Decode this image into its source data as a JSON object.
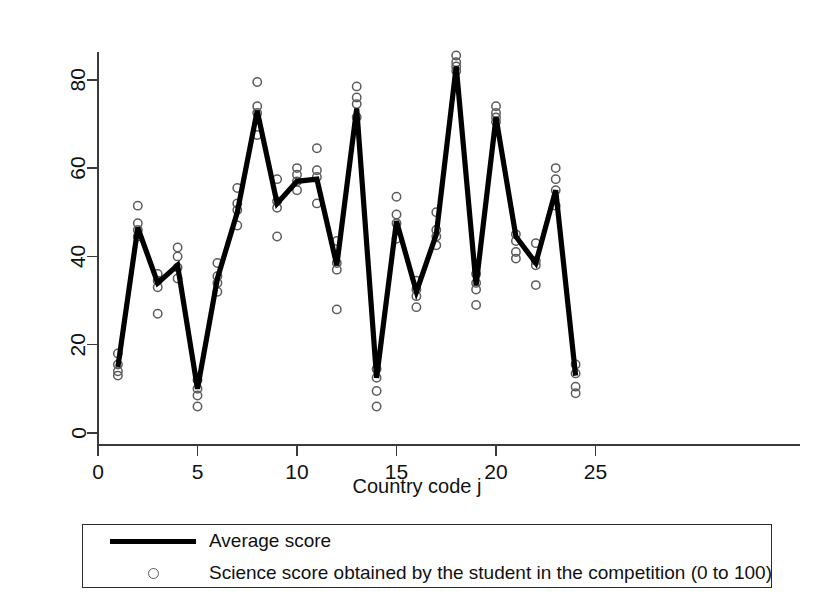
{
  "chart_data": {
    "type": "line",
    "title": "",
    "xlabel": "Country code j",
    "ylabel": "",
    "xlim": [
      0,
      25
    ],
    "ylim": [
      0,
      88
    ],
    "grid": false,
    "legend_position": "bottom",
    "x_ticks": [
      "0",
      "5",
      "10",
      "15",
      "20",
      "25"
    ],
    "x_tick_values": [
      0,
      5,
      10,
      15,
      20,
      25
    ],
    "y_ticks": [
      "0",
      "20",
      "40",
      "60",
      "80"
    ],
    "y_tick_values": [
      0,
      20,
      40,
      60,
      80
    ],
    "x": [
      1,
      2,
      3,
      4,
      5,
      6,
      7,
      8,
      9,
      10,
      11,
      12,
      13,
      14,
      15,
      16,
      17,
      18,
      19,
      20,
      21,
      22,
      23,
      24
    ],
    "series": [
      {
        "name": "Average score",
        "type": "line",
        "values": [
          15,
          46.5,
          34,
          38,
          10,
          35,
          50,
          73,
          52,
          57,
          57.5,
          38,
          73.5,
          12.5,
          48,
          32,
          45,
          83,
          33.5,
          71.5,
          44.5,
          38.5,
          55,
          13
        ]
      },
      {
        "name": "Science score obtained by the student in the competition (0 to 100)",
        "type": "scatter",
        "points": [
          {
            "x": 1,
            "y": 18
          },
          {
            "x": 1,
            "y": 15.5
          },
          {
            "x": 1,
            "y": 14
          },
          {
            "x": 1,
            "y": 13
          },
          {
            "x": 2,
            "y": 51.5
          },
          {
            "x": 2,
            "y": 47.5
          },
          {
            "x": 2,
            "y": 46
          },
          {
            "x": 2,
            "y": 44.5
          },
          {
            "x": 3,
            "y": 36
          },
          {
            "x": 3,
            "y": 34.5
          },
          {
            "x": 3,
            "y": 33
          },
          {
            "x": 3,
            "y": 27
          },
          {
            "x": 4,
            "y": 42
          },
          {
            "x": 4,
            "y": 40
          },
          {
            "x": 4,
            "y": 37.5
          },
          {
            "x": 4,
            "y": 35
          },
          {
            "x": 5,
            "y": 12
          },
          {
            "x": 5,
            "y": 10
          },
          {
            "x": 5,
            "y": 8.5
          },
          {
            "x": 5,
            "y": 6
          },
          {
            "x": 6,
            "y": 38.5
          },
          {
            "x": 6,
            "y": 35.5
          },
          {
            "x": 6,
            "y": 34
          },
          {
            "x": 6,
            "y": 32
          },
          {
            "x": 7,
            "y": 55.5
          },
          {
            "x": 7,
            "y": 52
          },
          {
            "x": 7,
            "y": 50.5
          },
          {
            "x": 7,
            "y": 47
          },
          {
            "x": 8,
            "y": 79.5
          },
          {
            "x": 8,
            "y": 74
          },
          {
            "x": 8,
            "y": 72.5
          },
          {
            "x": 8,
            "y": 67.5
          },
          {
            "x": 9,
            "y": 57.5
          },
          {
            "x": 9,
            "y": 52.5
          },
          {
            "x": 9,
            "y": 51
          },
          {
            "x": 9,
            "y": 44.5
          },
          {
            "x": 10,
            "y": 60
          },
          {
            "x": 10,
            "y": 58.5
          },
          {
            "x": 10,
            "y": 57
          },
          {
            "x": 10,
            "y": 55
          },
          {
            "x": 11,
            "y": 64.5
          },
          {
            "x": 11,
            "y": 59.5
          },
          {
            "x": 11,
            "y": 58
          },
          {
            "x": 11,
            "y": 52
          },
          {
            "x": 12,
            "y": 43.5
          },
          {
            "x": 12,
            "y": 38.5
          },
          {
            "x": 12,
            "y": 37
          },
          {
            "x": 12,
            "y": 28
          },
          {
            "x": 13,
            "y": 78.5
          },
          {
            "x": 13,
            "y": 76
          },
          {
            "x": 13,
            "y": 74.5
          },
          {
            "x": 13,
            "y": 71.5
          },
          {
            "x": 14,
            "y": 14.5
          },
          {
            "x": 14,
            "y": 12.5
          },
          {
            "x": 14,
            "y": 9.5
          },
          {
            "x": 14,
            "y": 6
          },
          {
            "x": 15,
            "y": 53.5
          },
          {
            "x": 15,
            "y": 49.5
          },
          {
            "x": 15,
            "y": 47.5
          },
          {
            "x": 15,
            "y": 44
          },
          {
            "x": 16,
            "y": 34.5
          },
          {
            "x": 16,
            "y": 32.5
          },
          {
            "x": 16,
            "y": 31
          },
          {
            "x": 16,
            "y": 28.5
          },
          {
            "x": 17,
            "y": 50
          },
          {
            "x": 17,
            "y": 46
          },
          {
            "x": 17,
            "y": 44.5
          },
          {
            "x": 17,
            "y": 42.5
          },
          {
            "x": 18,
            "y": 85.5
          },
          {
            "x": 18,
            "y": 84
          },
          {
            "x": 18,
            "y": 83
          },
          {
            "x": 18,
            "y": 82
          },
          {
            "x": 19,
            "y": 36
          },
          {
            "x": 19,
            "y": 34
          },
          {
            "x": 19,
            "y": 32.5
          },
          {
            "x": 19,
            "y": 29
          },
          {
            "x": 20,
            "y": 74
          },
          {
            "x": 20,
            "y": 72.5
          },
          {
            "x": 20,
            "y": 71.5
          },
          {
            "x": 20,
            "y": 70.5
          },
          {
            "x": 21,
            "y": 45
          },
          {
            "x": 21,
            "y": 43.5
          },
          {
            "x": 21,
            "y": 41
          },
          {
            "x": 21,
            "y": 39.5
          },
          {
            "x": 22,
            "y": 43
          },
          {
            "x": 22,
            "y": 39
          },
          {
            "x": 22,
            "y": 38
          },
          {
            "x": 22,
            "y": 33.5
          },
          {
            "x": 23,
            "y": 60
          },
          {
            "x": 23,
            "y": 57.5
          },
          {
            "x": 23,
            "y": 55
          },
          {
            "x": 23,
            "y": 51.5
          },
          {
            "x": 24,
            "y": 15.5
          },
          {
            "x": 24,
            "y": 13.5
          },
          {
            "x": 24,
            "y": 10.5
          },
          {
            "x": 24,
            "y": 9
          }
        ]
      }
    ]
  },
  "legend": {
    "entries": [
      {
        "key": "line",
        "label": "Average score"
      },
      {
        "key": "circle",
        "label": "Science score obtained by the student in the competition (0 to 100)"
      }
    ]
  },
  "colors": {
    "line": "#000000",
    "scatter": "#5c5c5c",
    "axis": "#3a3a3a",
    "text": "#111111",
    "background": "#ffffff"
  }
}
